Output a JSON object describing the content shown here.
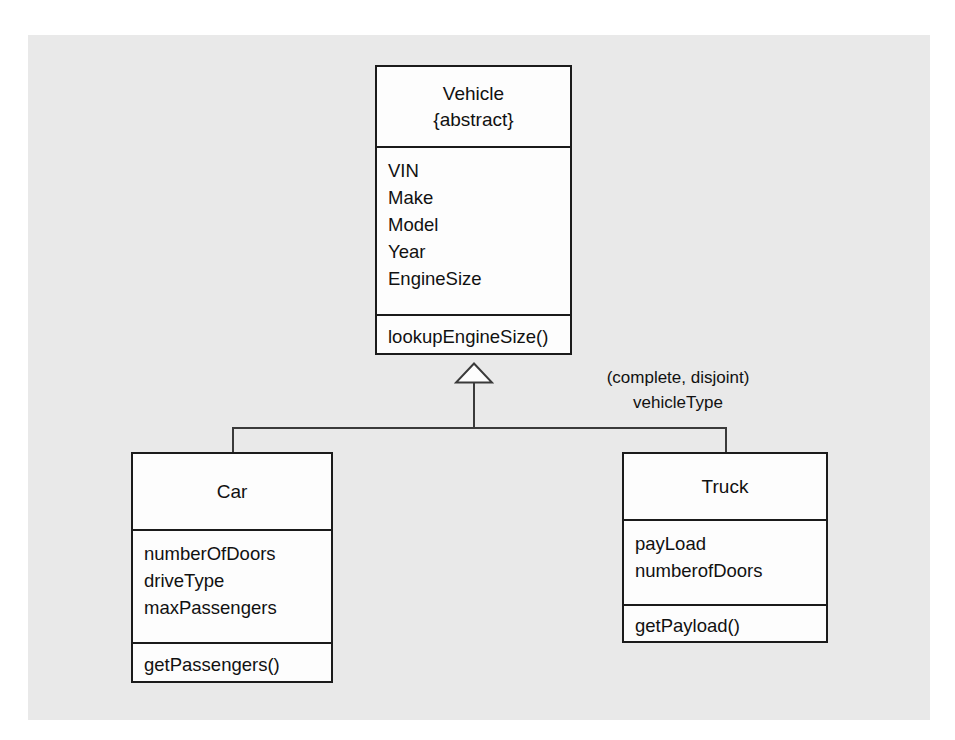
{
  "diagram": {
    "type": "uml-class-diagram",
    "background_color": "#e9e9e9",
    "page_color": "#ffffff",
    "line_color": "#3a3a3a",
    "box_border_color": "#1b1b1b",
    "box_fill_color": "#fdfdfd"
  },
  "classes": {
    "vehicle": {
      "name": "Vehicle",
      "stereotype": "{abstract}",
      "attributes": [
        "VIN",
        "Make",
        "Model",
        "Year",
        "EngineSize"
      ],
      "operations": [
        "lookupEngineSize()"
      ]
    },
    "car": {
      "name": "Car",
      "attributes": [
        "numberOfDoors",
        "driveType",
        "maxPassengers"
      ],
      "operations": [
        "getPassengers()"
      ]
    },
    "truck": {
      "name": "Truck",
      "attributes": [
        "payLoad",
        "numberofDoors"
      ],
      "operations": [
        "getPayload()"
      ]
    }
  },
  "generalization": {
    "constraint": "(complete, disjoint)",
    "discriminator": "vehicleType",
    "arrow_style": "hollow-triangle",
    "superclass": "Vehicle",
    "subclasses": [
      "Car",
      "Truck"
    ]
  }
}
